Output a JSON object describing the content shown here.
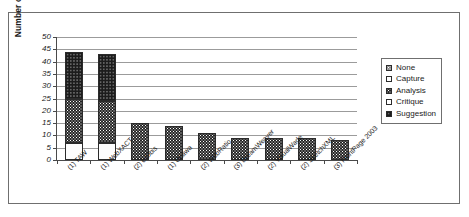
{
  "chart_data": {
    "type": "bar",
    "subtype": "stacked",
    "title": "",
    "xlabel": "",
    "ylabel": "Number of checkpoints",
    "ylim": [
      0,
      50
    ],
    "yticks": [
      0,
      5,
      10,
      15,
      20,
      25,
      30,
      35,
      40,
      45,
      50
    ],
    "grid": true,
    "legend_position": "right",
    "categories": [
      "(1) TAW",
      "(1) WebXACT",
      "(2) e-Obis",
      "(1) Ocawa",
      "(2) WebRatio",
      "(3) DreamWeaver",
      "(2) VisualWade",
      "(2) SketchXML",
      "(3) FrontPage 2003"
    ],
    "series": [
      {
        "name": "None",
        "values": [
          0,
          0,
          0,
          0,
          0,
          0,
          0,
          0,
          0
        ]
      },
      {
        "name": "Capture",
        "values": [
          7,
          7,
          0,
          0,
          0,
          0,
          0,
          0,
          0
        ]
      },
      {
        "name": "Analysis",
        "values": [
          18,
          17,
          15,
          14,
          11,
          9,
          9,
          9,
          8
        ]
      },
      {
        "name": "Critique",
        "values": [
          0,
          0,
          0,
          0,
          0,
          0,
          0,
          0,
          0
        ]
      },
      {
        "name": "Suggestion",
        "values": [
          19,
          19,
          0,
          0,
          0,
          0,
          0,
          0,
          0
        ]
      }
    ],
    "totals": [
      44,
      43,
      15,
      14,
      11,
      9,
      9,
      9,
      8
    ]
  },
  "legend": {
    "items": [
      {
        "label": "None",
        "pattern": "pat-none"
      },
      {
        "label": "Capture",
        "pattern": "pat-capture"
      },
      {
        "label": "Analysis",
        "pattern": "pat-analysis"
      },
      {
        "label": "Critique",
        "pattern": "pat-critique"
      },
      {
        "label": "Suggestion",
        "pattern": "pat-suggestion"
      }
    ]
  },
  "colors": {
    "frame": "#6f6f6f",
    "axis": "#4a4a4a",
    "grid": "#9b9b9b",
    "text": "#1a1a1a",
    "background": "#ffffff"
  }
}
